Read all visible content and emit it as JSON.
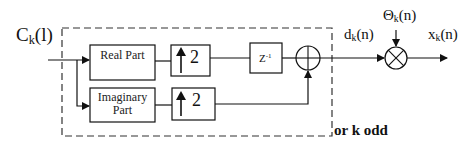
{
  "diagram": {
    "input_label": {
      "main": "C",
      "sub": "k",
      "arg": "(l)"
    },
    "blocks": {
      "real_part": "Real Part",
      "imaginary_part_line1": "Imaginary",
      "imaginary_part_line2": "Part",
      "upsample_top": "2",
      "upsample_bottom": "2",
      "delay_main": "Z",
      "delay_exp": "-1"
    },
    "signals": {
      "d": {
        "main": "d",
        "sub": "k",
        "arg": "(n)"
      },
      "theta": {
        "main": "Θ",
        "sub": "k",
        "arg": "(n)"
      },
      "x": {
        "main": "x",
        "sub": "k",
        "arg": "(n)"
      }
    },
    "annotation": "or k odd",
    "operators": {
      "summer": "adder-circle",
      "multiplier": "multiplier-circle"
    }
  }
}
